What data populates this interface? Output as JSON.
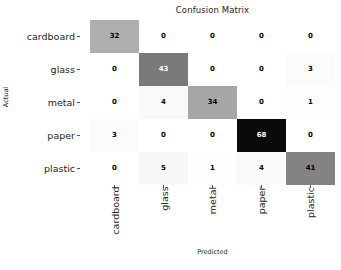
{
  "chart_data": {
    "type": "heatmap",
    "title": "Confusion Matrix",
    "xlabel": "Predicted",
    "ylabel": "Actual",
    "categories": [
      "cardboard",
      "glass",
      "metal",
      "paper",
      "plastic"
    ],
    "x_tick_labels": [
      "cardboard",
      "glass",
      "metal",
      "paper",
      "plastic"
    ],
    "y_tick_labels": [
      "cardboard",
      "glass",
      "metal",
      "paper",
      "plastic"
    ],
    "grid": false,
    "legend": "none",
    "colormap": "Greys",
    "vmin": 0,
    "vmax": 68,
    "matrix": [
      [
        32,
        0,
        0,
        0,
        0
      ],
      [
        0,
        43,
        0,
        0,
        3
      ],
      [
        0,
        4,
        34,
        0,
        1
      ],
      [
        3,
        0,
        0,
        68,
        0
      ],
      [
        0,
        5,
        1,
        4,
        41
      ]
    ],
    "rows": [
      {
        "actual": "cardboard",
        "values": [
          32,
          0,
          0,
          0,
          0
        ]
      },
      {
        "actual": "glass",
        "values": [
          0,
          43,
          0,
          0,
          3
        ]
      },
      {
        "actual": "metal",
        "values": [
          0,
          4,
          34,
          0,
          1
        ]
      },
      {
        "actual": "paper",
        "values": [
          3,
          0,
          0,
          68,
          0
        ]
      },
      {
        "actual": "plastic",
        "values": [
          0,
          5,
          1,
          4,
          41
        ]
      }
    ]
  },
  "style": {
    "text_color": "#262626",
    "tick_color": "#555555",
    "background": "#ffffff",
    "cell_dark": "#1a1a1a",
    "cell_light": "#ffffff"
  }
}
